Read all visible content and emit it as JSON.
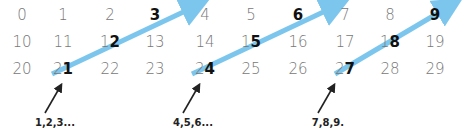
{
  "grid": {
    "rows": [
      [
        "0",
        "1",
        "2",
        "3",
        "4",
        "5",
        "6",
        "7",
        "8",
        "9"
      ],
      [
        "10",
        "11",
        "12",
        "13",
        "14",
        "15",
        "16",
        "17",
        "18",
        "19"
      ],
      [
        "20",
        "21",
        "22",
        "23",
        "24",
        "25",
        "26",
        "27",
        "28",
        "29"
      ]
    ],
    "highlighted": [
      "3",
      "6",
      "9",
      "12",
      "15",
      "18",
      "21",
      "24",
      "27"
    ]
  },
  "labels": [
    "1,2,3...",
    "4,5,6...",
    "7,8,9."
  ],
  "colors": {
    "diagonal_arrow": "#7cc6ee",
    "pointer_arrow": "#222222",
    "digit": "#777777",
    "digit_highlight": "#111111"
  }
}
